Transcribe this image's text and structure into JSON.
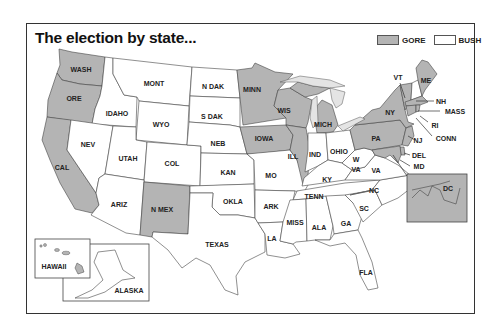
{
  "map": {
    "title": "The election by state...",
    "legend": [
      {
        "label": "GORE",
        "color": "#b4b4b4"
      },
      {
        "label": "BUSH",
        "color": "#ffffff"
      }
    ],
    "colors": {
      "gore": "#b4b4b4",
      "bush": "#ffffff",
      "border": "#444444",
      "lakes": "#e4e4e4"
    },
    "states": {
      "WASH": {
        "label": "WASH",
        "winner": "GORE"
      },
      "ORE": {
        "label": "ORE",
        "winner": "GORE"
      },
      "CAL": {
        "label": "CAL",
        "winner": "GORE"
      },
      "IDAHO": {
        "label": "IDAHO",
        "winner": "BUSH"
      },
      "NEV": {
        "label": "NEV",
        "winner": "BUSH"
      },
      "MONT": {
        "label": "MONT",
        "winner": "BUSH"
      },
      "WYO": {
        "label": "WYO",
        "winner": "BUSH"
      },
      "UTAH": {
        "label": "UTAH",
        "winner": "BUSH"
      },
      "COL": {
        "label": "COL",
        "winner": "BUSH"
      },
      "ARIZ": {
        "label": "ARIZ",
        "winner": "BUSH"
      },
      "N MEX": {
        "label": "N MEX",
        "winner": "GORE"
      },
      "N DAK": {
        "label": "N DAK",
        "winner": "BUSH"
      },
      "S DAK": {
        "label": "S DAK",
        "winner": "BUSH"
      },
      "NEB": {
        "label": "NEB",
        "winner": "BUSH"
      },
      "KAN": {
        "label": "KAN",
        "winner": "BUSH"
      },
      "OKLA": {
        "label": "OKLA",
        "winner": "BUSH"
      },
      "TEXAS": {
        "label": "TEXAS",
        "winner": "BUSH"
      },
      "MINN": {
        "label": "MINN",
        "winner": "GORE"
      },
      "IOWA": {
        "label": "IOWA",
        "winner": "GORE"
      },
      "MO": {
        "label": "MO",
        "winner": "BUSH"
      },
      "ARK": {
        "label": "ARK",
        "winner": "BUSH"
      },
      "LA": {
        "label": "LA",
        "winner": "BUSH"
      },
      "WIS": {
        "label": "WIS",
        "winner": "GORE"
      },
      "ILL": {
        "label": "ILL",
        "winner": "GORE"
      },
      "MICH": {
        "label": "MICH",
        "winner": "GORE"
      },
      "IND": {
        "label": "IND",
        "winner": "BUSH"
      },
      "OHIO": {
        "label": "OHIO",
        "winner": "BUSH"
      },
      "KY": {
        "label": "KY",
        "winner": "BUSH"
      },
      "TENN": {
        "label": "TENN",
        "winner": "BUSH"
      },
      "MISS": {
        "label": "MISS",
        "winner": "BUSH"
      },
      "ALA": {
        "label": "ALA",
        "winner": "BUSH"
      },
      "GA": {
        "label": "GA",
        "winner": "BUSH"
      },
      "FLA": {
        "label": "FLA",
        "winner": "BUSH"
      },
      "SC": {
        "label": "SC",
        "winner": "BUSH"
      },
      "NC": {
        "label": "NC",
        "winner": "BUSH"
      },
      "VA": {
        "label": "VA",
        "winner": "BUSH"
      },
      "W VA": {
        "label_line1": "W",
        "label_line2": "VA",
        "winner": "BUSH"
      },
      "PA": {
        "label": "PA",
        "winner": "GORE"
      },
      "NY": {
        "label": "NY",
        "winner": "GORE"
      },
      "VT": {
        "label": "VT",
        "winner": "GORE"
      },
      "NH": {
        "label": "NH",
        "winner": "BUSH"
      },
      "ME": {
        "label": "ME",
        "winner": "GORE"
      },
      "MASS": {
        "label": "MASS",
        "winner": "GORE"
      },
      "RI": {
        "label": "RI",
        "winner": "GORE"
      },
      "CONN": {
        "label": "CONN",
        "winner": "GORE"
      },
      "NJ": {
        "label": "NJ",
        "winner": "GORE"
      },
      "DEL": {
        "label": "DEL",
        "winner": "GORE"
      },
      "MD": {
        "label": "MD",
        "winner": "GORE"
      },
      "DC": {
        "label": "DC",
        "winner": "GORE"
      },
      "HAWAII": {
        "label": "HAWAII",
        "winner": "GORE"
      },
      "ALASKA": {
        "label": "ALASKA",
        "winner": "BUSH"
      }
    }
  }
}
